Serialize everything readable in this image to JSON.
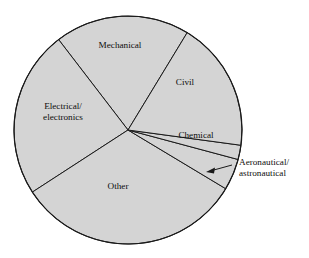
{
  "chart_data": {
    "type": "pie",
    "title": "",
    "subtitle": "",
    "xlabel": "",
    "ylabel": "",
    "legend_position": "none",
    "grid": false,
    "labels_inside": true,
    "units": "degrees of arc",
    "total_degrees": 360,
    "categories": [
      "Mechanical",
      "Electrical/ electronics",
      "Other",
      "Aeronautical/ astronautical",
      "Chemical",
      "Civil"
    ],
    "values": [
      19.1,
      23.8,
      32.2,
      4.4,
      2.0,
      18.5
    ],
    "slices": [
      {
        "name": "mechanical",
        "label": "Mechanical",
        "label_line_1": "Mechanical",
        "label_line_2": "",
        "start_angle_deg": 58.7,
        "end_angle_deg": 127.5,
        "sweep_deg": 68.8,
        "percent": 19.1,
        "label_x": 120,
        "label_y": 46,
        "callout": false
      },
      {
        "name": "electrical-electronics",
        "label": "Electrical/ electronics",
        "label_line_1": "Electrical/",
        "label_line_2": "electronics",
        "start_angle_deg": 127.5,
        "end_angle_deg": 213.0,
        "sweep_deg": 85.5,
        "percent": 23.8,
        "label_x": 63,
        "label_y": 112,
        "callout": false
      },
      {
        "name": "other",
        "label": "Other",
        "label_line_1": "Other",
        "label_line_2": "",
        "start_angle_deg": 213.0,
        "end_angle_deg": 329.0,
        "sweep_deg": 116.0,
        "percent": 32.2,
        "label_x": 118,
        "label_y": 187,
        "callout": false
      },
      {
        "name": "aeronautical-astronautical",
        "label": "Aeronautical/ astronautical",
        "label_line_1": "Aeronautical/",
        "label_line_2": "astronautical",
        "start_angle_deg": 329.0,
        "end_angle_deg": 345.0,
        "sweep_deg": 16.0,
        "percent": 4.4,
        "label_x": 239,
        "label_y": 168,
        "callout": true
      },
      {
        "name": "chemical",
        "label": "Chemical",
        "label_line_1": "Chemical",
        "label_line_2": "",
        "start_angle_deg": 345.0,
        "end_angle_deg": 352.3,
        "sweep_deg": 7.3,
        "percent": 2.0,
        "label_x": 196,
        "label_y": 136,
        "callout": false
      },
      {
        "name": "civil",
        "label": "Civil",
        "label_line_1": "Civil",
        "label_line_2": "",
        "start_angle_deg": 352.3,
        "end_angle_deg": 418.7,
        "sweep_deg": 66.4,
        "percent": 18.5,
        "label_x": 185,
        "label_y": 83,
        "callout": false
      }
    ],
    "geometry": {
      "center_x": 128,
      "center_y": 130,
      "radius": 114
    },
    "callout_annotation": {
      "line_1": "Aeronautical/",
      "line_2": "astronautical",
      "arrow_tip_x": 206,
      "arrow_tip_y": 172,
      "leader_start_x": 232,
      "leader_start_y": 165
    },
    "colors": {
      "slice_fill": "#d4d4d4",
      "slice_stroke": "#1a1a1a",
      "background": "#ffffff",
      "text": "#0d0d0d"
    }
  }
}
